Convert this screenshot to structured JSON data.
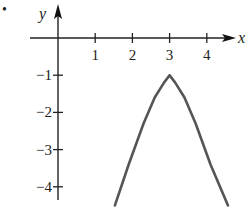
{
  "figure": {
    "marker": "•"
  },
  "chart_data": {
    "type": "line",
    "title": "",
    "xlabel": "x",
    "ylabel": "y",
    "x_ticks": [
      1,
      2,
      3,
      4
    ],
    "x_tick_labels": [
      "1",
      "2",
      "3",
      "4"
    ],
    "y_ticks": [
      -1,
      -2,
      -3,
      -4
    ],
    "y_tick_labels": [
      "−1",
      "−2",
      "−3",
      "−4"
    ],
    "xlim": [
      -0.8,
      4.9
    ],
    "ylim": [
      -4.6,
      1.0
    ],
    "grid": false,
    "legend": null,
    "series": [
      {
        "name": "curve",
        "color": "#555555",
        "description": "Downward cusp-shaped curve symmetric about x = 3 with peak at (3, -1)",
        "points": [
          {
            "x": 1.53,
            "y": -4.5
          },
          {
            "x": 1.9,
            "y": -3.4
          },
          {
            "x": 2.3,
            "y": -2.3
          },
          {
            "x": 2.6,
            "y": -1.6
          },
          {
            "x": 2.85,
            "y": -1.2
          },
          {
            "x": 3.0,
            "y": -1.0
          },
          {
            "x": 3.15,
            "y": -1.2
          },
          {
            "x": 3.4,
            "y": -1.6
          },
          {
            "x": 3.7,
            "y": -2.3
          },
          {
            "x": 4.1,
            "y": -3.4
          },
          {
            "x": 4.57,
            "y": -4.5
          }
        ]
      }
    ],
    "annotations": [
      {
        "text": "(3, -1)",
        "role": "apex of curve",
        "shown_as_label": false
      }
    ]
  }
}
